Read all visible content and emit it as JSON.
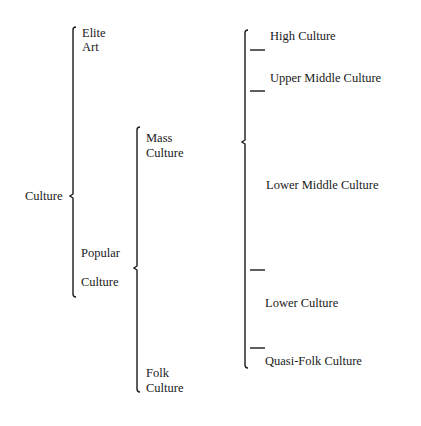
{
  "diagram": {
    "root": "Culture",
    "level1": {
      "elite": [
        "Elite",
        "Art"
      ],
      "popular": [
        "Popular",
        "Culture"
      ]
    },
    "level2": {
      "mass": [
        "Mass",
        "Culture"
      ],
      "folk": [
        "Folk",
        "Culture"
      ]
    },
    "level3": [
      "High Culture",
      "Upper Middle Culture",
      "Lower Middle Culture",
      "Lower Culture",
      "Quasi-Folk Culture"
    ]
  }
}
